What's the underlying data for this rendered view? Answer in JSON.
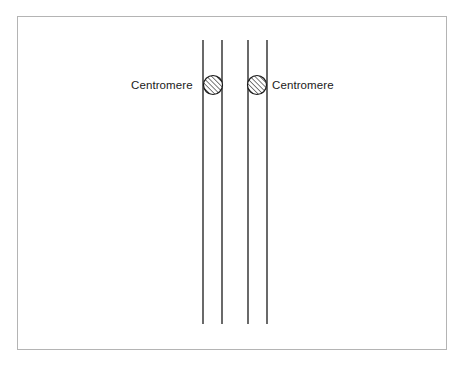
{
  "figure": {
    "background_color": "#ffffff",
    "frame": {
      "stroke_color": "#b4b4b4",
      "stroke_width": 1,
      "x": 17,
      "y": 16,
      "width": 430,
      "height": 334
    }
  },
  "labels": {
    "left": "Centromere",
    "right": "Centromere"
  },
  "diagram_data": {
    "type": "schematic",
    "description": "Two sister chromatid pairs drawn as vertical line pairs, each bearing a hatched circular centromere near the top.",
    "stroke_color": "#1a1a1a",
    "chromatid_line_width": 1.3,
    "chromatid_top_y": 40,
    "chromatid_bottom_y": 324,
    "chromatids": [
      {
        "name": "chromatid-1",
        "x": 203
      },
      {
        "name": "chromatid-2",
        "x": 222
      },
      {
        "name": "chromatid-3",
        "x": 248
      },
      {
        "name": "chromatid-4",
        "x": 267
      }
    ],
    "centromeres": [
      {
        "name": "centromere-left",
        "cx": 213,
        "cy": 85,
        "r": 9.5,
        "fill": "#ffffff",
        "stroke": "#1a1a1a",
        "hatch": "diagonal-45",
        "hatch_color": "#2b2b2b"
      },
      {
        "name": "centromere-right",
        "cx": 257,
        "cy": 85,
        "r": 9.5,
        "fill": "#ffffff",
        "stroke": "#1a1a1a",
        "hatch": "diagonal-45",
        "hatch_color": "#2b2b2b"
      }
    ]
  }
}
